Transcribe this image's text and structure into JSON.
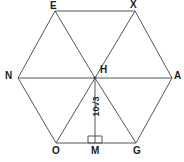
{
  "figure": {
    "kind": "geometry-diagram",
    "shape": "regular-hexagon",
    "stroke_color": "#555555",
    "label_color": "#1d1d1d",
    "background_color": "#ffffff",
    "vertices": {
      "E": "E",
      "X": "X",
      "A": "A",
      "G": "G",
      "O": "O",
      "N": "N"
    },
    "center": {
      "label": "H"
    },
    "foot_of_apothem": {
      "label": "M"
    },
    "measures": {
      "apothem": "10√3"
    },
    "marks": {
      "right_angle_at": "M"
    }
  },
  "geometry": {
    "hexagon_points": "55,11 135,11 172,78 136,143 56,143 18,78",
    "vertex_coords": {
      "E": [
        55,
        11
      ],
      "X": [
        135,
        11
      ],
      "A": [
        172,
        78
      ],
      "G": [
        136,
        143
      ],
      "O": [
        56,
        143
      ],
      "N": [
        18,
        78
      ],
      "H": [
        95,
        78
      ],
      "M": [
        95,
        143
      ]
    },
    "diagonals": [
      "95,78 55,11",
      "95,78 135,11",
      "95,78 172,78",
      "95,78 136,143",
      "95,78 56,143",
      "95,78 18,78"
    ],
    "apothem_segment": "95,78 95,143",
    "right_angle_square": "88,136 102,136 102,143 88,143"
  }
}
